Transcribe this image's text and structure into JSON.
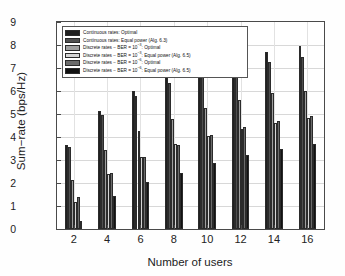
{
  "chart_data": {
    "type": "bar",
    "title": "",
    "xlabel": "Number of users",
    "ylabel": "Sum−rate (bps/Hz)",
    "categories": [
      "2",
      "4",
      "6",
      "8",
      "10",
      "12",
      "14",
      "16"
    ],
    "xtick_labels": [
      "2",
      "4",
      "6",
      "8",
      "10",
      "12",
      "14",
      "16"
    ],
    "ytick_labels": [
      "0",
      "1",
      "2",
      "3",
      "4",
      "5",
      "6",
      "7",
      "8",
      "9"
    ],
    "ylim": [
      0,
      9
    ],
    "xlim": [
      1,
      17
    ],
    "grid": true,
    "legend_position": "upper left",
    "series": [
      {
        "name": "Continuous rates: Optimal",
        "color": "#202020",
        "values": [
          3.65,
          5.15,
          6.02,
          6.6,
          7.05,
          7.4,
          7.7,
          7.95
        ]
      },
      {
        "name": "Continuous rates: Equal power (Alg. 6.3)",
        "color": "#4f4f4f",
        "values": [
          3.58,
          4.95,
          5.78,
          6.33,
          6.72,
          7.02,
          7.28,
          7.5
        ]
      },
      {
        "name": "Discrete rates − BER = 10−3: Optimal",
        "name_base": "Discrete rates − BER = 10",
        "name_exp": "−3",
        "name_tail": ": Optimal",
        "color": "#9e9e9e",
        "values": [
          2.15,
          3.45,
          4.25,
          4.8,
          5.25,
          5.6,
          5.92,
          6.0
        ]
      },
      {
        "name": "Discrete rates − BER = 10−3: Equal power (Alg. 6.5)",
        "name_base": "Discrete rates − BER = 10",
        "name_exp": "−3",
        "name_tail": ": Equal power (Alg. 6.5)",
        "color": "#d5d5d5",
        "values": [
          1.18,
          2.38,
          3.15,
          3.68,
          4.03,
          4.35,
          4.6,
          4.83
        ]
      },
      {
        "name": "Discrete rates − BER = 10−6: Optimal",
        "name_base": "Discrete rates − BER = 10",
        "name_exp": "−6",
        "name_tail": ": Optimal",
        "color": "#6b6b6b",
        "values": [
          1.38,
          2.42,
          3.12,
          3.65,
          4.1,
          4.42,
          4.7,
          4.92
        ]
      },
      {
        "name": "Discrete rates − BER = 10−6: Equal power (Alg. 6.5)",
        "name_base": "Discrete rates − BER = 10",
        "name_exp": "−6",
        "name_tail": ": Equal power (Alg. 6.5)",
        "color": "#121212",
        "values": [
          0.35,
          1.42,
          2.05,
          2.45,
          2.85,
          3.2,
          3.48,
          3.68
        ]
      }
    ]
  }
}
